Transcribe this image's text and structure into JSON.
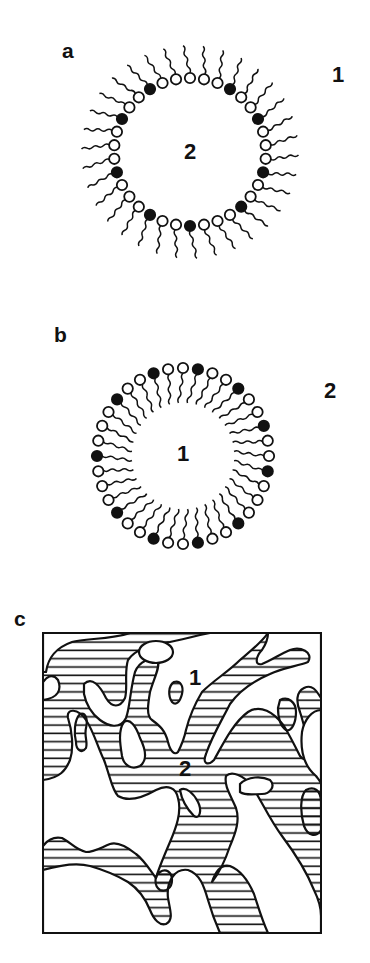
{
  "figure": {
    "panels": [
      {
        "id": "a",
        "label": "a",
        "structure": "micelle",
        "outer_region_label": "1",
        "inner_region_label": "2",
        "description": "Direct micelle: polar heads (open and filled circles) on surface, hydrocarbon tails pointing outward into region 1"
      },
      {
        "id": "b",
        "label": "b",
        "structure": "reverse micelle",
        "outer_region_label": "2",
        "inner_region_label": "1",
        "description": "Reverse micelle: polar heads on outside, tails pointing inward toward region 1"
      },
      {
        "id": "c",
        "label": "c",
        "structure": "bicontinuous microemulsion",
        "region_label_1": "1",
        "region_label_2": "2",
        "description": "Bicontinuous structure: hatched domains (1) interpenetrating with white domains (2)"
      }
    ],
    "colors": {
      "ink": "#111111",
      "background": "#ffffff",
      "filled_head": "#111111",
      "open_head": "#ffffff"
    }
  }
}
